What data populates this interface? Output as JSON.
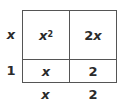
{
  "diagram": {
    "type": "area-model",
    "row_labels": [
      "x",
      "1"
    ],
    "column_labels": [
      "x",
      "2"
    ],
    "cells": [
      [
        {
          "base": "x",
          "exponent": "2"
        },
        {
          "coef": "2",
          "var": "x"
        }
      ],
      [
        {
          "var": "x"
        },
        {
          "value": "2"
        }
      ]
    ],
    "colors": {
      "text": "#2b2b2b",
      "lines": "#555555",
      "background": "#ffffff"
    }
  }
}
